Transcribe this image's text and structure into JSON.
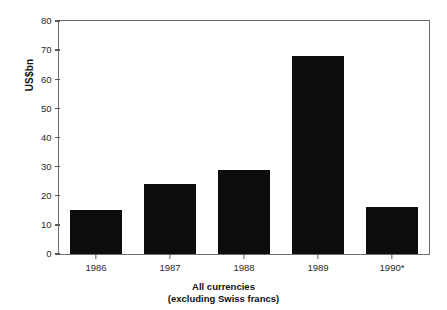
{
  "chart_data": {
    "type": "bar",
    "title": "",
    "subtitle": "",
    "xlabel": "All currencies (excluding Swiss francs)",
    "ylabel": "US$bn",
    "categories": [
      "1986",
      "1987",
      "1988",
      "1989",
      "1990*"
    ],
    "values": [
      15,
      24,
      29,
      68,
      16
    ],
    "series": [
      {
        "name": "All currencies (excluding Swiss francs)",
        "values": [
          15,
          24,
          29,
          68,
          16
        ]
      }
    ],
    "ylim": [
      0,
      80
    ],
    "ytick_labels": [
      "0",
      "10",
      "20",
      "30",
      "40",
      "50",
      "60",
      "70",
      "80"
    ],
    "ytick_values": [
      0,
      10,
      20,
      30,
      40,
      50,
      60,
      70,
      80
    ],
    "grid": false,
    "legend": false,
    "legend_position": "none",
    "bar_color": "#0d0d0d",
    "frame_color": "#6e6e6e",
    "background_color": "#ffffff",
    "annotations": []
  },
  "axes": {
    "y_title": "US$bn",
    "ticks": [
      {
        "label": "80",
        "value": 80
      },
      {
        "label": "70",
        "value": 70
      },
      {
        "label": "60",
        "value": 60
      },
      {
        "label": "50",
        "value": 50
      },
      {
        "label": "40",
        "value": 40
      },
      {
        "label": "30",
        "value": 30
      },
      {
        "label": "20",
        "value": 20
      },
      {
        "label": "10",
        "value": 10
      },
      {
        "label": "0",
        "value": 0
      }
    ]
  },
  "caption": {
    "line1": "All currencies",
    "line2": "(excluding Swiss francs)"
  }
}
